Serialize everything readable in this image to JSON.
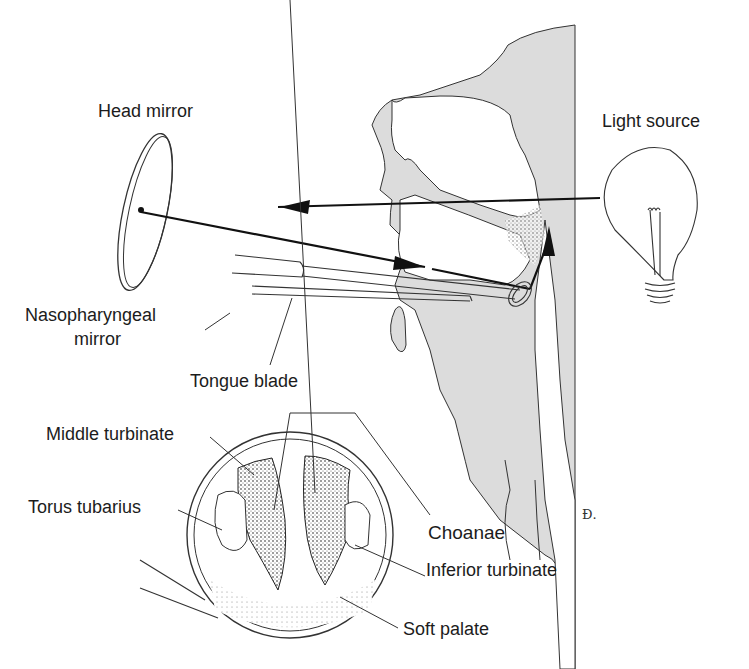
{
  "figure": {
    "labels": {
      "head_mirror": "Head mirror",
      "light_source": "Light source",
      "nasopharyngeal_mirror_line1": "Nasopharyngeal",
      "nasopharyngeal_mirror_line2": "mirror",
      "tongue_blade": "Tongue blade",
      "middle_turbinate": "Middle turbinate",
      "torus_tubarius": "Torus tubarius",
      "choanae": "Choanae",
      "inferior_turbinate": "Inferior turbinate",
      "soft_palate": "Soft palate"
    },
    "signature": "Ɖ.",
    "colors": {
      "ink": "#1c1c1c",
      "tissue_fill": "#dcdcdc",
      "background": "#ffffff"
    }
  }
}
